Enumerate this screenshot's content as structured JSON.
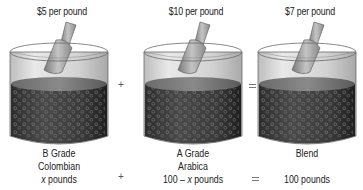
{
  "diagram": {
    "type": "mixture-equation",
    "containers": [
      {
        "id": "b-grade",
        "price": "$5 per pound",
        "label_line1": "B Grade",
        "label_line2": "Colombian",
        "quantity_var": "x",
        "quantity_suffix": " pounds"
      },
      {
        "id": "a-grade",
        "price": "$10 per pound",
        "label_line1": "A Grade",
        "label_line2": "Arabica",
        "quantity_prefix": "100 – ",
        "quantity_var": "x",
        "quantity_suffix": " pounds"
      },
      {
        "id": "blend",
        "price": "$7 per pound",
        "label_line1": "Blend",
        "quantity": "100 pounds"
      }
    ],
    "operators": {
      "plus": "+",
      "equals": "="
    },
    "colors": {
      "glass": "#d8d8d8",
      "glass_edge": "#6a6a6a",
      "coffee_top": "#5e5e5e",
      "coffee_bottom": "#2a2a2a",
      "scoop": "#9a9a9a"
    }
  }
}
